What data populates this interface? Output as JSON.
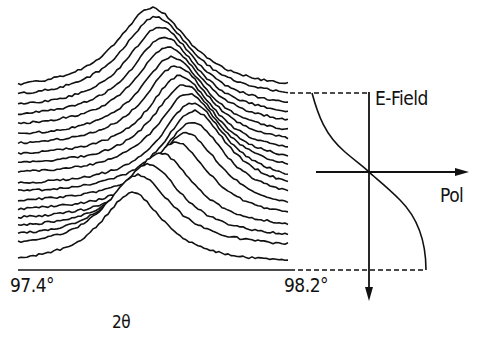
{
  "figure": {
    "x_axis": {
      "min_label": "97.4°",
      "max_label": "98.2°",
      "title": "2θ"
    },
    "field_plot": {
      "vertical_axis_label": "E-Field",
      "horizontal_axis_label": "Pol"
    },
    "stroke_color": "#111111",
    "background": "#ffffff"
  },
  "chart_data": {
    "type": "line",
    "title": "",
    "xlabel": "2θ",
    "x_range_deg": [
      97.4,
      98.2
    ],
    "series_count": 19,
    "profiles": [
      {
        "baseline": 92,
        "peak_x": 152,
        "height": 84,
        "width": 55
      },
      {
        "baseline": 101,
        "peak_x": 156,
        "height": 84,
        "width": 54
      },
      {
        "baseline": 111,
        "peak_x": 160,
        "height": 84,
        "width": 53
      },
      {
        "baseline": 120,
        "peak_x": 164,
        "height": 83,
        "width": 52
      },
      {
        "baseline": 129,
        "peak_x": 168,
        "height": 82,
        "width": 52
      },
      {
        "baseline": 139,
        "peak_x": 172,
        "height": 82,
        "width": 51
      },
      {
        "baseline": 148,
        "peak_x": 176,
        "height": 82,
        "width": 51
      },
      {
        "baseline": 158,
        "peak_x": 180,
        "height": 82,
        "width": 50
      },
      {
        "baseline": 167,
        "peak_x": 184,
        "height": 82,
        "width": 50
      },
      {
        "baseline": 176,
        "peak_x": 188,
        "height": 82,
        "width": 50
      },
      {
        "baseline": 187,
        "peak_x": 192,
        "height": 84,
        "width": 50
      },
      {
        "baseline": 195,
        "peak_x": 194,
        "height": 84,
        "width": 50
      },
      {
        "baseline": 204,
        "peak_x": 192,
        "height": 82,
        "width": 50
      },
      {
        "baseline": 213,
        "peak_x": 186,
        "height": 80,
        "width": 50
      },
      {
        "baseline": 222,
        "peak_x": 176,
        "height": 80,
        "width": 50
      },
      {
        "baseline": 231,
        "peak_x": 160,
        "height": 78,
        "width": 50
      },
      {
        "baseline": 240,
        "peak_x": 148,
        "height": 76,
        "width": 50
      },
      {
        "baseline": 249,
        "peak_x": 138,
        "height": 74,
        "width": 50
      },
      {
        "baseline": 265,
        "peak_x": 132,
        "height": 72,
        "width": 48
      }
    ],
    "field_curve": {
      "type": "line",
      "xlabel": "Pol",
      "ylabel": "E-Field",
      "shape": "inverted sigmoid through origin"
    }
  }
}
